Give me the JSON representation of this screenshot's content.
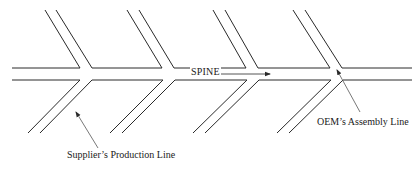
{
  "diagram": {
    "type": "fishbone",
    "labels": {
      "spine": "SPINE",
      "supplier": "Supplier’s Production Line",
      "oem": "OEM’s Assembly Line"
    },
    "colors": {
      "line": "#2a2a2a",
      "pointer": "#555555",
      "background": "#ffffff"
    },
    "spine": {
      "top_y": 68,
      "bottom_y": 80,
      "x_start": 12,
      "x_end": 412
    },
    "upper_branches": [
      {
        "top_x": [
          45,
          56
        ],
        "join_x": [
          80,
          92
        ]
      },
      {
        "top_x": [
          127,
          139
        ],
        "join_x": [
          162,
          174
        ]
      },
      {
        "top_x": [
          213,
          225
        ],
        "join_x": [
          246,
          258
        ]
      },
      {
        "top_x": [
          293,
          305
        ],
        "join_x": [
          330,
          342
        ]
      }
    ],
    "lower_branches": [
      {
        "bottom_x": [
          28,
          40
        ],
        "join_x": [
          80,
          92
        ]
      },
      {
        "bottom_x": [
          110,
          122
        ],
        "join_x": [
          163,
          175
        ]
      },
      {
        "bottom_x": [
          193,
          205
        ],
        "join_x": [
          247,
          259
        ]
      },
      {
        "bottom_x": [
          277,
          289
        ],
        "join_x": [
          331,
          343
        ]
      }
    ]
  }
}
